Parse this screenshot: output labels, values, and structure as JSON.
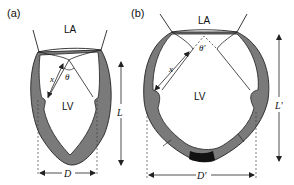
{
  "panels": [
    {
      "id": "a",
      "label": "(a)",
      "chambers": {
        "atrium": "LA",
        "ventricle": "LV"
      },
      "angle_label": "θ",
      "length_arrow_label": "x",
      "long_axis_label": "L",
      "diameter_label": "D"
    },
    {
      "id": "b",
      "label": "(b)",
      "chambers": {
        "atrium": "LA",
        "ventricle": "LV"
      },
      "angle_label": "θ'",
      "length_arrow_label": "x",
      "long_axis_label": "L'",
      "diameter_label": "D'"
    }
  ],
  "colors": {
    "wall": "#7a7a7a",
    "scar": "#111111",
    "line": "#222222",
    "background": "#ffffff"
  }
}
